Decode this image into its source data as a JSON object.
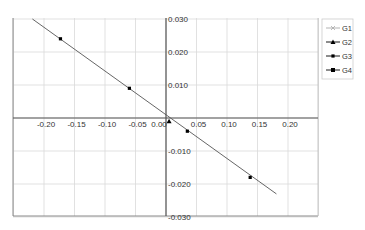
{
  "chart_data": {
    "type": "line",
    "title": "",
    "xlabel": "",
    "ylabel": "",
    "xlim": [
      -0.25,
      0.25
    ],
    "ylim": [
      -0.03,
      0.03
    ],
    "grid": true,
    "legend_position": "right-top",
    "x_ticks": [
      "-0.20",
      "-0.15",
      "-0.10",
      "-0.05",
      "0.00",
      "0.05",
      "0.10",
      "0.15",
      "0.20"
    ],
    "y_ticks": [
      "0.030",
      "0.020",
      "0.010",
      "-0.010",
      "-0.020",
      "-0.030"
    ],
    "series": [
      {
        "name": "G1",
        "marker": "x",
        "color": "#aaaaaa",
        "points": [
          [
            -0.219,
            0.03
          ],
          [
            0.181,
            -0.023
          ]
        ]
      },
      {
        "name": "G2",
        "marker": "triangle",
        "color": "#000000",
        "points": [
          [
            0.005,
            -0.001
          ]
        ]
      },
      {
        "name": "G3",
        "marker": "small-square",
        "color": "#000000",
        "points": [
          [
            -0.173,
            0.024
          ],
          [
            -0.06,
            0.009
          ],
          [
            0.035,
            -0.004
          ],
          [
            0.138,
            -0.018
          ]
        ]
      },
      {
        "name": "G4",
        "marker": "square",
        "color": "#000000",
        "points": []
      }
    ],
    "trend_line": {
      "from": [
        -0.219,
        0.03
      ],
      "to": [
        0.181,
        -0.023
      ],
      "color": "#555555"
    }
  },
  "legend": {
    "items": [
      "G1",
      "G2",
      "G3",
      "G4"
    ]
  }
}
